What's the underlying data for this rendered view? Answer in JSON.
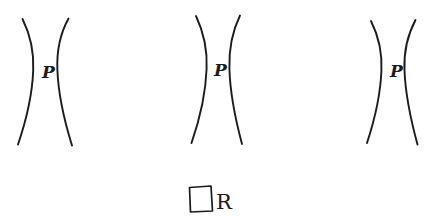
{
  "figure": {
    "background_color": "#ffffff",
    "ink_color": "#1b1b1b",
    "style": "hand-drawn pen sketch",
    "width": 432,
    "height": 223
  },
  "groups": [
    {
      "id": "group-1",
      "label": "P",
      "label_x": 42,
      "label_y": 78,
      "left_curve": "M 22.5,19 C 30.5,35 34.0,53 33.2,70.5 C 32.4,92 27.0,118 18.0,144.5",
      "right_curve": "M 68.5,18.5 C 60.0,34 56.6,52 57.4,70.0 C 58.2,92 63.5,118 72.0,145.5"
    },
    {
      "id": "group-2",
      "label": "P",
      "label_x": 214,
      "label_y": 76,
      "left_curve": "M 196.0,16 C 204.0,33 207.5,51 206.6,69.0 C 205.8,91 200.5,117 191.5,143.0",
      "right_curve": "M 240.0,15.5 C 232.0,32 228.8,50 229.4,68.5 C 230.0,90 234.5,116 242.0,144.0"
    },
    {
      "id": "group-3",
      "label": "P",
      "label_x": 390,
      "label_y": 77,
      "left_curve": "M 371.0,21 C 379.0,37 382.3,54 381.4,71.0 C 380.6,92 375.5,117 367.0,143.0",
      "right_curve": "M 415.5,20 C 407.0,36 403.7,53 404.5,70.5 C 405.3,91 410.0,117 417.5,144.5"
    }
  ],
  "legend": {
    "square_label": "rectangle-symbol",
    "text": "R",
    "square_path": "M 189.5,187.5 L 211.0,186.0 L 212.5,211.0 L 190.5,212.0 Z",
    "text_x": 216,
    "text_y": 209
  }
}
